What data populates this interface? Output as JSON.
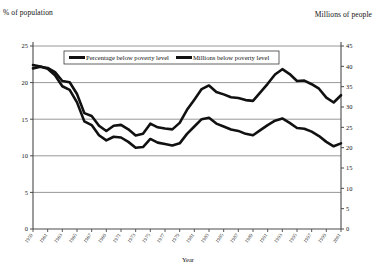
{
  "labels": {
    "left_axis_title": "% of population",
    "right_axis_title": "Millions of people",
    "x_axis_title": "Year"
  },
  "legend": {
    "items": [
      {
        "label": "Percentage below poverty level"
      },
      {
        "label": "Millions below poverty level"
      }
    ]
  },
  "chart_data": {
    "type": "line",
    "title": "",
    "xlabel": "Year",
    "ylabel": "% of population",
    "y2label": "Millions of people",
    "grid": true,
    "legend_position": "top-center",
    "xlim": [
      1959,
      2001
    ],
    "ylim": [
      0,
      25
    ],
    "y2lim": [
      0,
      45
    ],
    "yticks": [
      0,
      5,
      10,
      15,
      20,
      25
    ],
    "y2ticks": [
      0,
      5,
      10,
      15,
      20,
      25,
      30,
      35,
      40,
      45
    ],
    "xticks": [
      1959,
      1961,
      1963,
      1965,
      1967,
      1969,
      1971,
      1973,
      1975,
      1977,
      1979,
      1981,
      1983,
      1985,
      1987,
      1989,
      1991,
      1993,
      1995,
      1997,
      1999,
      2001
    ],
    "x": [
      1959,
      1960,
      1961,
      1962,
      1963,
      1964,
      1965,
      1966,
      1967,
      1968,
      1969,
      1970,
      1971,
      1972,
      1973,
      1974,
      1975,
      1976,
      1977,
      1978,
      1979,
      1980,
      1981,
      1982,
      1983,
      1984,
      1985,
      1986,
      1987,
      1988,
      1989,
      1990,
      1991,
      1992,
      1993,
      1994,
      1995,
      1996,
      1997,
      1998,
      1999,
      2000,
      2001
    ],
    "series": [
      {
        "name": "Percentage below poverty level",
        "axis": "left",
        "color": "#111111",
        "values": [
          22.4,
          22.2,
          21.9,
          21.0,
          19.5,
          19.0,
          17.3,
          14.7,
          14.2,
          12.8,
          12.1,
          12.6,
          12.5,
          11.9,
          11.1,
          11.2,
          12.3,
          11.8,
          11.6,
          11.4,
          11.7,
          13.0,
          14.0,
          15.0,
          15.2,
          14.4,
          14.0,
          13.6,
          13.4,
          13.0,
          12.8,
          13.5,
          14.2,
          14.8,
          15.1,
          14.5,
          13.8,
          13.7,
          13.3,
          12.7,
          11.9,
          11.3,
          11.7
        ]
      },
      {
        "name": "Millions below poverty level",
        "axis": "right",
        "color": "#111111",
        "values": [
          39.5,
          39.9,
          39.6,
          38.6,
          36.4,
          36.1,
          33.2,
          28.5,
          27.8,
          25.4,
          24.1,
          25.4,
          25.6,
          24.5,
          23.0,
          23.4,
          25.9,
          25.0,
          24.7,
          24.5,
          26.1,
          29.3,
          31.8,
          34.4,
          35.3,
          33.7,
          33.1,
          32.4,
          32.2,
          31.7,
          31.5,
          33.6,
          35.7,
          38.0,
          39.3,
          38.1,
          36.4,
          36.5,
          35.6,
          34.5,
          32.3,
          31.1,
          32.9
        ]
      }
    ]
  }
}
